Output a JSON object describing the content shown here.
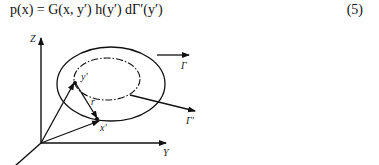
{
  "equation": {
    "text": "p(x) = G(x, y′) h(y′) dΓ′(y′)",
    "number": "(5)"
  },
  "figure": {
    "labels": {
      "z_axis": "Z",
      "y_axis": "Y",
      "point_y": "y′",
      "point_x": "x′",
      "vector_r": "r",
      "gamma": "Γ",
      "gamma_prime": "Γ′"
    }
  }
}
